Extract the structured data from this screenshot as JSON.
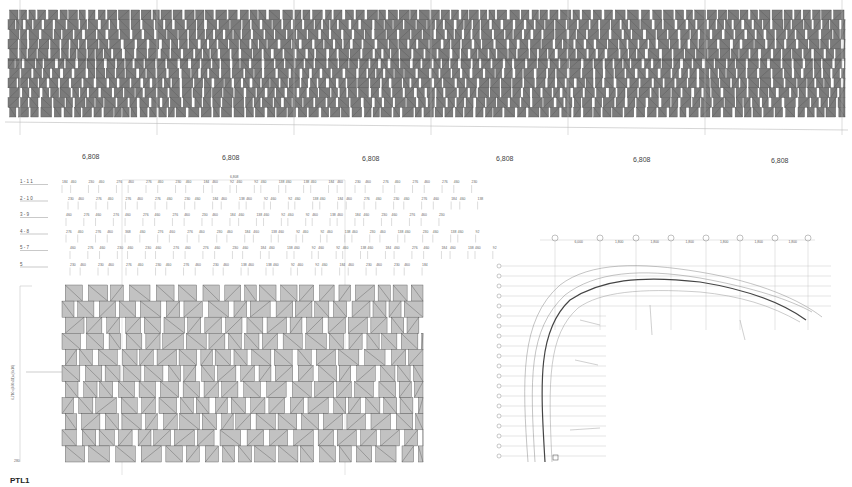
{
  "drawing": {
    "top_elevation": {
      "bounds": {
        "x": 8,
        "y": 10,
        "w": 837,
        "h": 107
      },
      "rows": 11,
      "bay_dimensions": [
        "6,808",
        "6,808",
        "6,808",
        "6,808",
        "6,808",
        "6,808"
      ],
      "bay_label_positions": [
        82,
        222,
        362,
        496,
        633,
        771
      ],
      "grid_x": [
        20,
        157,
        294,
        431,
        568,
        705,
        842
      ]
    },
    "panel_schedule": {
      "header_dimension": "6,808",
      "rows": [
        {
          "label": "1 - 1 1",
          "values": [
            "184",
            "460",
            "230",
            "460",
            "276",
            "460",
            "276",
            "460",
            "230",
            "460",
            "184",
            "460",
            "92",
            "460",
            "92",
            "460",
            "138",
            "460",
            "138",
            "460",
            "184",
            "460",
            "230",
            "460",
            "276",
            "460",
            "276",
            "460",
            "276",
            "460",
            "230"
          ]
        },
        {
          "label": "2 - 1 0",
          "values": [
            "230",
            "460",
            "276",
            "460",
            "276",
            "460",
            "276",
            "460",
            "230",
            "460",
            "184",
            "460",
            "138",
            "460",
            "92",
            "460",
            "92",
            "460",
            "138",
            "460",
            "184",
            "460",
            "276",
            "460",
            "230",
            "460",
            "276",
            "460",
            "184",
            "460",
            "138"
          ]
        },
        {
          "label": "3 - 9",
          "values": [
            "460",
            "276",
            "460",
            "276",
            "460",
            "276",
            "460",
            "276",
            "460",
            "230",
            "460",
            "184",
            "460",
            "138",
            "460",
            "92",
            "460",
            "92",
            "460",
            "138",
            "460",
            "184",
            "460",
            "230",
            "460",
            "276",
            "460",
            "230"
          ]
        },
        {
          "label": "4 - 8",
          "values": [
            "276",
            "460",
            "276",
            "460",
            "368",
            "460",
            "276",
            "460",
            "276",
            "460",
            "230",
            "460",
            "184",
            "460",
            "138",
            "460",
            "92",
            "460",
            "92",
            "460",
            "138",
            "460",
            "230",
            "460",
            "138",
            "460",
            "230",
            "460",
            "138",
            "460",
            "92"
          ]
        },
        {
          "label": "5 - 7",
          "values": [
            "460",
            "276",
            "460",
            "230",
            "460",
            "230",
            "460",
            "276",
            "460",
            "276",
            "460",
            "230",
            "460",
            "184",
            "460",
            "138",
            "460",
            "92",
            "460",
            "92",
            "460",
            "138",
            "460",
            "184",
            "460",
            "276",
            "460",
            "184",
            "460",
            "138",
            "460",
            "92"
          ]
        },
        {
          "label": "5",
          "values": [
            "230",
            "460",
            "230",
            "460",
            "276",
            "460",
            "230",
            "460",
            "276",
            "460",
            "230",
            "460",
            "138",
            "460",
            "138",
            "460",
            "92",
            "460",
            "92",
            "460",
            "184",
            "460",
            "230",
            "460",
            "230",
            "460",
            "184"
          ]
        }
      ]
    },
    "elevation_detail": {
      "bounds": {
        "x": 62,
        "y": 285,
        "w": 361,
        "h": 177
      },
      "rows": 11,
      "vertical_dimension": "6,710=(460x11)+(6x10)",
      "bottom_dimension": "280"
    },
    "plan": {
      "grid_top_labels": [
        "A",
        "B",
        "C",
        "D",
        "E",
        "F",
        "G",
        "H"
      ],
      "grid_top_x": [
        555,
        600,
        636,
        671,
        706,
        740,
        775,
        808
      ],
      "grid_left_count": 20,
      "bay_labels": [
        "6,000",
        "1,800",
        "1,800",
        "1,800",
        "1,800",
        "1,800",
        "1,800"
      ]
    },
    "footer_label": "PTL1"
  },
  "colors": {
    "panel_fill": "#7b7b7b",
    "panel_fill_light": "#c2c2c2",
    "line": "#555555",
    "grid": "#bbbbbb"
  }
}
